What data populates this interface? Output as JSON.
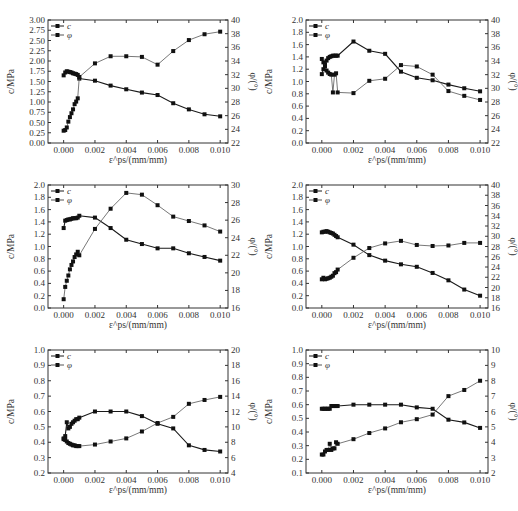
{
  "figure": {
    "caption": ""
  },
  "chart_data": [
    {
      "type": "line",
      "panel": "top-left",
      "xlabel": "ε^ps/(mm/mm)",
      "ylabel_left": "c/MPa",
      "ylabel_right": "φ/(°)",
      "x_ticks": [
        "0.000",
        "0.002",
        "0.004",
        "0.006",
        "0.008",
        "0.010"
      ],
      "xlim": [
        -0.001,
        0.0105
      ],
      "ylim_left": [
        0,
        3.0
      ],
      "y_ticks_left": [
        "0.00",
        "0.25",
        "0.50",
        "0.75",
        "1.00",
        "1.25",
        "1.50",
        "1.75",
        "2.00",
        "2.25",
        "2.50",
        "2.75",
        "3.00"
      ],
      "ylim_right": [
        22,
        41
      ],
      "y_ticks_right": [
        "22",
        "24",
        "26",
        "28",
        "30",
        "32",
        "34",
        "36",
        "38",
        "40"
      ],
      "legend": [
        "c",
        "φ"
      ],
      "series": [
        {
          "name": "c",
          "axis": "left",
          "x": [
            0.0,
            0.0001,
            0.0002,
            0.0003,
            0.0004,
            0.0005,
            0.0006,
            0.0007,
            0.0008,
            0.0009,
            0.001,
            0.002,
            0.003,
            0.004,
            0.005,
            0.006,
            0.007,
            0.008,
            0.009,
            0.01
          ],
          "y": [
            1.65,
            1.72,
            1.75,
            1.74,
            1.73,
            1.72,
            1.7,
            1.69,
            1.68,
            1.66,
            1.57,
            1.52,
            1.4,
            1.31,
            1.23,
            1.17,
            0.97,
            0.82,
            0.7,
            0.65
          ]
        },
        {
          "name": "φ",
          "axis": "right",
          "x": [
            0.0,
            0.0001,
            0.0002,
            0.0003,
            0.0004,
            0.0005,
            0.0006,
            0.0007,
            0.0008,
            0.0009,
            0.001,
            0.002,
            0.003,
            0.004,
            0.005,
            0.006,
            0.007,
            0.008,
            0.009,
            0.01
          ],
          "y": [
            23.9,
            24.0,
            24.4,
            25.3,
            26.0,
            26.6,
            27.2,
            28.0,
            28.4,
            28.9,
            32.2,
            34.3,
            35.4,
            35.4,
            35.3,
            34.1,
            36.2,
            37.9,
            38.8,
            39.2
          ]
        }
      ]
    },
    {
      "type": "line",
      "panel": "top-right",
      "xlabel": "ε^ps/(mm/mm)",
      "ylabel_left": "c/MPa",
      "ylabel_right": "φ/(°)",
      "x_ticks": [
        "0.000",
        "0.002",
        "0.004",
        "0.006",
        "0.008",
        "0.010"
      ],
      "xlim": [
        -0.001,
        0.0105
      ],
      "ylim_left": [
        0,
        2.0
      ],
      "y_ticks_left": [
        "0.0",
        "0.2",
        "0.4",
        "0.6",
        "0.8",
        "1.0",
        "1.2",
        "1.4",
        "1.6",
        "1.8",
        "2.0"
      ],
      "ylim_right": [
        22,
        40
      ],
      "y_ticks_right": [
        "22",
        "24",
        "26",
        "28",
        "30",
        "32",
        "34",
        "36",
        "38",
        "40"
      ],
      "legend": [
        "c",
        "φ"
      ],
      "series": [
        {
          "name": "c",
          "axis": "left",
          "x": [
            0.0,
            0.0001,
            0.0002,
            0.0003,
            0.0004,
            0.0005,
            0.0006,
            0.0007,
            0.0008,
            0.0009,
            0.001,
            0.002,
            0.003,
            0.004,
            0.005,
            0.006,
            0.007,
            0.008,
            0.009,
            0.01
          ],
          "y": [
            1.12,
            1.2,
            1.28,
            1.34,
            1.38,
            1.4,
            1.41,
            1.42,
            1.42,
            1.42,
            1.42,
            1.65,
            1.5,
            1.45,
            1.16,
            1.06,
            1.02,
            0.95,
            0.89,
            0.84
          ]
        },
        {
          "name": "φ",
          "axis": "right",
          "x": [
            0.0,
            0.0001,
            0.0002,
            0.0003,
            0.0004,
            0.0005,
            0.0006,
            0.0007,
            0.0008,
            0.0009,
            0.001,
            0.002,
            0.003,
            0.004,
            0.005,
            0.006,
            0.007,
            0.008,
            0.009,
            0.01
          ],
          "y": [
            34.3,
            33.8,
            33.2,
            32.6,
            32.3,
            32.1,
            32.0,
            29.4,
            32.0,
            32.2,
            29.4,
            29.3,
            31.1,
            31.4,
            33.4,
            33.2,
            32.0,
            29.6,
            28.9,
            28.3
          ]
        }
      ]
    },
    {
      "type": "line",
      "panel": "middle-left",
      "xlabel": "ε^ps/(mm/mm)",
      "ylabel_left": "c/MPa",
      "ylabel_right": "φ/(°)",
      "x_ticks": [
        "0.000",
        "0.002",
        "0.004",
        "0.006",
        "0.008",
        "0.010"
      ],
      "xlim": [
        -0.001,
        0.0105
      ],
      "ylim_left": [
        0,
        2.0
      ],
      "y_ticks_left": [
        "0.0",
        "0.2",
        "0.4",
        "0.6",
        "0.8",
        "1.0",
        "1.2",
        "1.4",
        "1.6",
        "1.8",
        "2.0"
      ],
      "ylim_right": [
        16,
        30
      ],
      "y_ticks_right": [
        "16",
        "18",
        "20",
        "22",
        "24",
        "26",
        "28",
        "30"
      ],
      "legend": [
        "c",
        "φ"
      ],
      "series": [
        {
          "name": "c",
          "axis": "left",
          "x": [
            0.0,
            0.0001,
            0.0002,
            0.0003,
            0.0004,
            0.0005,
            0.0006,
            0.0007,
            0.0008,
            0.0009,
            0.001,
            0.002,
            0.003,
            0.004,
            0.005,
            0.006,
            0.007,
            0.008,
            0.009,
            0.01
          ],
          "y": [
            1.3,
            1.42,
            1.43,
            1.44,
            1.44,
            1.45,
            1.46,
            1.46,
            1.46,
            1.47,
            1.5,
            1.47,
            1.3,
            1.11,
            1.04,
            0.97,
            0.97,
            0.89,
            0.83,
            0.77
          ]
        },
        {
          "name": "φ",
          "axis": "right",
          "x": [
            0.0,
            0.0001,
            0.0002,
            0.0003,
            0.0004,
            0.0005,
            0.0006,
            0.0007,
            0.0008,
            0.0009,
            0.001,
            0.002,
            0.003,
            0.004,
            0.005,
            0.006,
            0.007,
            0.008,
            0.009,
            0.01
          ],
          "y": [
            17.0,
            18.4,
            19.1,
            19.7,
            20.4,
            20.9,
            21.3,
            21.8,
            22.1,
            22.4,
            22.0,
            25.0,
            27.3,
            29.1,
            28.9,
            27.7,
            26.4,
            25.9,
            25.4,
            24.7
          ]
        }
      ]
    },
    {
      "type": "line",
      "panel": "middle-right",
      "xlabel": "ε^ps/(mm/mm)",
      "ylabel_left": "c/MPa",
      "ylabel_right": "φ/(°)",
      "x_ticks": [
        "0.000",
        "0.002",
        "0.004",
        "0.006",
        "0.008",
        "0.010"
      ],
      "xlim": [
        -0.001,
        0.0105
      ],
      "ylim_left": [
        0,
        2.0
      ],
      "y_ticks_left": [
        "0.0",
        "0.2",
        "0.4",
        "0.6",
        "0.8",
        "1.0",
        "1.2",
        "1.4",
        "1.6",
        "1.8",
        "2.0"
      ],
      "ylim_right": [
        16,
        40
      ],
      "y_ticks_right": [
        "16",
        "18",
        "20",
        "22",
        "24",
        "26",
        "28",
        "30",
        "32",
        "34",
        "36",
        "38",
        "40"
      ],
      "legend": [
        "c",
        "φ"
      ],
      "series": [
        {
          "name": "c",
          "axis": "left",
          "x": [
            0.0,
            0.0001,
            0.0002,
            0.0003,
            0.0004,
            0.0005,
            0.0006,
            0.0007,
            0.0008,
            0.0009,
            0.001,
            0.002,
            0.003,
            0.004,
            0.005,
            0.006,
            0.007,
            0.008,
            0.009,
            0.01
          ],
          "y": [
            1.23,
            1.24,
            1.24,
            1.25,
            1.24,
            1.23,
            1.22,
            1.21,
            1.19,
            1.17,
            1.15,
            1.03,
            0.86,
            0.77,
            0.71,
            0.67,
            0.57,
            0.45,
            0.3,
            0.2
          ]
        },
        {
          "name": "φ",
          "axis": "right",
          "x": [
            0.0,
            0.0001,
            0.0002,
            0.0003,
            0.0004,
            0.0005,
            0.0006,
            0.0007,
            0.0008,
            0.0009,
            0.001,
            0.002,
            0.003,
            0.004,
            0.005,
            0.006,
            0.007,
            0.008,
            0.009,
            0.01
          ],
          "y": [
            21.6,
            21.9,
            21.6,
            21.7,
            21.8,
            21.9,
            22.1,
            22.3,
            22.8,
            23.0,
            23.5,
            25.8,
            27.7,
            28.6,
            29.1,
            28.3,
            28.1,
            28.2,
            28.7,
            28.7
          ]
        }
      ]
    },
    {
      "type": "line",
      "panel": "bottom-left",
      "xlabel": "ε^ps/(mm/mm)",
      "ylabel_left": "c/MPa",
      "ylabel_right": "φ/(°)",
      "x_ticks": [
        "0.000",
        "0.002",
        "0.004",
        "0.006",
        "0.008",
        "0.010"
      ],
      "xlim": [
        -0.001,
        0.0105
      ],
      "ylim_left": [
        0.2,
        1.0
      ],
      "y_ticks_left": [
        "0.2",
        "0.3",
        "0.4",
        "0.5",
        "0.6",
        "0.7",
        "0.8",
        "0.9",
        "1.0"
      ],
      "ylim_right": [
        4,
        20
      ],
      "y_ticks_right": [
        "4",
        "6",
        "8",
        "10",
        "12",
        "14",
        "16",
        "18",
        "20"
      ],
      "legend": [
        "c",
        "φ"
      ],
      "series": [
        {
          "name": "c",
          "axis": "left",
          "x": [
            0.0,
            0.0001,
            0.0002,
            0.0003,
            0.0004,
            0.0005,
            0.0006,
            0.0007,
            0.0008,
            0.0009,
            0.001,
            0.002,
            0.003,
            0.004,
            0.005,
            0.006,
            0.007,
            0.008,
            0.009,
            0.01
          ],
          "y": [
            0.42,
            0.44,
            0.53,
            0.49,
            0.5,
            0.52,
            0.53,
            0.54,
            0.55,
            0.55,
            0.56,
            0.6,
            0.6,
            0.6,
            0.57,
            0.52,
            0.49,
            0.38,
            0.35,
            0.34
          ]
        },
        {
          "name": "φ",
          "axis": "right",
          "x": [
            0.0,
            0.0001,
            0.0002,
            0.0003,
            0.0004,
            0.0005,
            0.0006,
            0.0007,
            0.0008,
            0.0009,
            0.001,
            0.002,
            0.003,
            0.004,
            0.005,
            0.006,
            0.007,
            0.008,
            0.009,
            0.01
          ],
          "y": [
            8.5,
            8.3,
            8.1,
            7.9,
            7.8,
            7.7,
            7.6,
            7.6,
            7.5,
            7.5,
            7.5,
            7.7,
            8.1,
            8.5,
            9.4,
            10.5,
            11.3,
            13.0,
            13.5,
            13.9
          ]
        }
      ]
    },
    {
      "type": "line",
      "panel": "bottom-right",
      "xlabel": "ε^ps/(mm/mm)",
      "ylabel_left": "c/MPa",
      "ylabel_right": "φ/(°)",
      "x_ticks": [
        "0.000",
        "0.002",
        "0.004",
        "0.006",
        "0.008",
        "0.010"
      ],
      "xlim": [
        -0.001,
        0.0105
      ],
      "ylim_left": [
        0.1,
        1.0
      ],
      "y_ticks_left": [
        "0.1",
        "0.2",
        "0.3",
        "0.4",
        "0.5",
        "0.6",
        "0.7",
        "0.8",
        "0.9",
        "1.0"
      ],
      "ylim_right": [
        2,
        10
      ],
      "y_ticks_right": [
        "2",
        "3",
        "4",
        "5",
        "6",
        "7",
        "8",
        "9",
        "10"
      ],
      "legend": [
        "c",
        "φ"
      ],
      "series": [
        {
          "name": "c",
          "axis": "left",
          "x": [
            0.0,
            0.0001,
            0.0002,
            0.0003,
            0.0004,
            0.0005,
            0.0006,
            0.0007,
            0.0008,
            0.0009,
            0.001,
            0.002,
            0.003,
            0.004,
            0.005,
            0.006,
            0.007,
            0.008,
            0.009,
            0.01
          ],
          "y": [
            0.57,
            0.57,
            0.57,
            0.57,
            0.57,
            0.57,
            0.59,
            0.59,
            0.59,
            0.59,
            0.59,
            0.6,
            0.6,
            0.6,
            0.6,
            0.58,
            0.57,
            0.49,
            0.47,
            0.43
          ]
        },
        {
          "name": "φ",
          "axis": "right",
          "x": [
            0.0,
            0.0001,
            0.0002,
            0.0003,
            0.0004,
            0.0005,
            0.0006,
            0.0007,
            0.0008,
            0.0009,
            0.001,
            0.002,
            0.003,
            0.004,
            0.005,
            0.006,
            0.007,
            0.008,
            0.009,
            0.01
          ],
          "y": [
            3.2,
            3.2,
            3.4,
            3.5,
            3.5,
            3.9,
            3.5,
            3.6,
            3.6,
            4.0,
            3.9,
            4.2,
            4.6,
            4.9,
            5.3,
            5.5,
            5.8,
            7.0,
            7.4,
            8.0
          ]
        }
      ]
    }
  ],
  "panels": [
    {
      "left": 0,
      "top": 5,
      "width": 258,
      "height": 160
    },
    {
      "left": 258,
      "top": 5,
      "width": 260,
      "height": 160
    },
    {
      "left": 0,
      "top": 170,
      "width": 258,
      "height": 160
    },
    {
      "left": 258,
      "top": 170,
      "width": 260,
      "height": 160
    },
    {
      "left": 0,
      "top": 335,
      "width": 258,
      "height": 160
    },
    {
      "left": 258,
      "top": 335,
      "width": 260,
      "height": 160
    }
  ],
  "style": {
    "c_color": "#1a1a1a",
    "phi_color": "#555555",
    "axis_color": "#333333"
  }
}
